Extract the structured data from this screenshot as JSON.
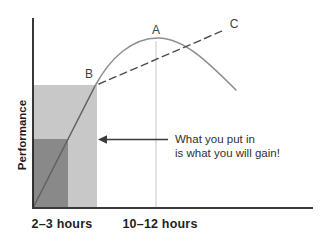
{
  "figure": {
    "ylabel": "Performance",
    "x_tick_labels": [
      "2–3 hours",
      "10–12 hours"
    ],
    "point_labels": [
      "A",
      "B",
      "C"
    ],
    "annotation_line1": "What you put in",
    "annotation_line2": "is what you will gain!"
  },
  "colors": {
    "background": "#ffffff",
    "light_region": "#c8c8c8",
    "dark_region": "#898989",
    "curve_rising": "#606060",
    "curve_arc": "#8f8f8f",
    "dashed_line": "#4d4d4d",
    "guide_line": "#c4c4c4",
    "arrow": "#3b3b3b",
    "y_axis": "#222222",
    "x_axis": "#3a3a3a",
    "label_text": "#414141",
    "tick_text": "#1f1f1f"
  },
  "chart_data": {
    "type": "line",
    "title": "",
    "xlabel": "",
    "ylabel": "Performance",
    "canvas": {
      "width": 333,
      "height": 246
    },
    "axes": {
      "origin_x": 33,
      "origin_y": 208,
      "top_y": 18,
      "right_x": 313
    },
    "x_ticks": [
      {
        "label": "2–3 hours",
        "px": 62,
        "baseline_y": 228
      },
      {
        "label": "10–12 hours",
        "px": 160,
        "baseline_y": 228
      }
    ],
    "ylabel_pos": {
      "x": 26,
      "y": 135
    },
    "regions": [
      {
        "name": "region-light-effort",
        "x": 33,
        "y": 85,
        "w": 64,
        "h": 123,
        "color": "#c8c8c8"
      },
      {
        "name": "region-dark-effort",
        "x": 33,
        "y": 139,
        "w": 35,
        "h": 69,
        "color": "#898989"
      }
    ],
    "guides": [
      {
        "name": "guide-10-12-hours",
        "x": 156,
        "y1": 41,
        "y2": 208,
        "color": "#c4c4c4"
      }
    ],
    "series": [
      {
        "name": "performance-curve-rising",
        "style": "solid",
        "color": "#606060",
        "width": 1.5,
        "path": "M33,208 L95,86"
      },
      {
        "name": "performance-curve-arc",
        "style": "solid",
        "color": "#8f8f8f",
        "width": 1.6,
        "path": "M95,86 C110,58 132,38 158,38 C184,38 209,63 236,90"
      },
      {
        "name": "expectation-dashed-line",
        "style": "dashed",
        "color": "#4d4d4d",
        "width": 1.4,
        "dash": "7 4.5",
        "path": "M99,84 L222,31"
      }
    ],
    "point_labels": [
      {
        "label": "A",
        "x": 156,
        "y": 34
      },
      {
        "label": "B",
        "x": 89,
        "y": 78
      },
      {
        "label": "C",
        "x": 234,
        "y": 28
      }
    ],
    "arrow": {
      "tip_x": 98,
      "tail_x": 168,
      "y": 139.5,
      "head_len": 9,
      "head_half": 4.2,
      "color": "#3b3b3b"
    },
    "annotation": {
      "x": 175,
      "y1": 143,
      "y2": 157
    }
  }
}
